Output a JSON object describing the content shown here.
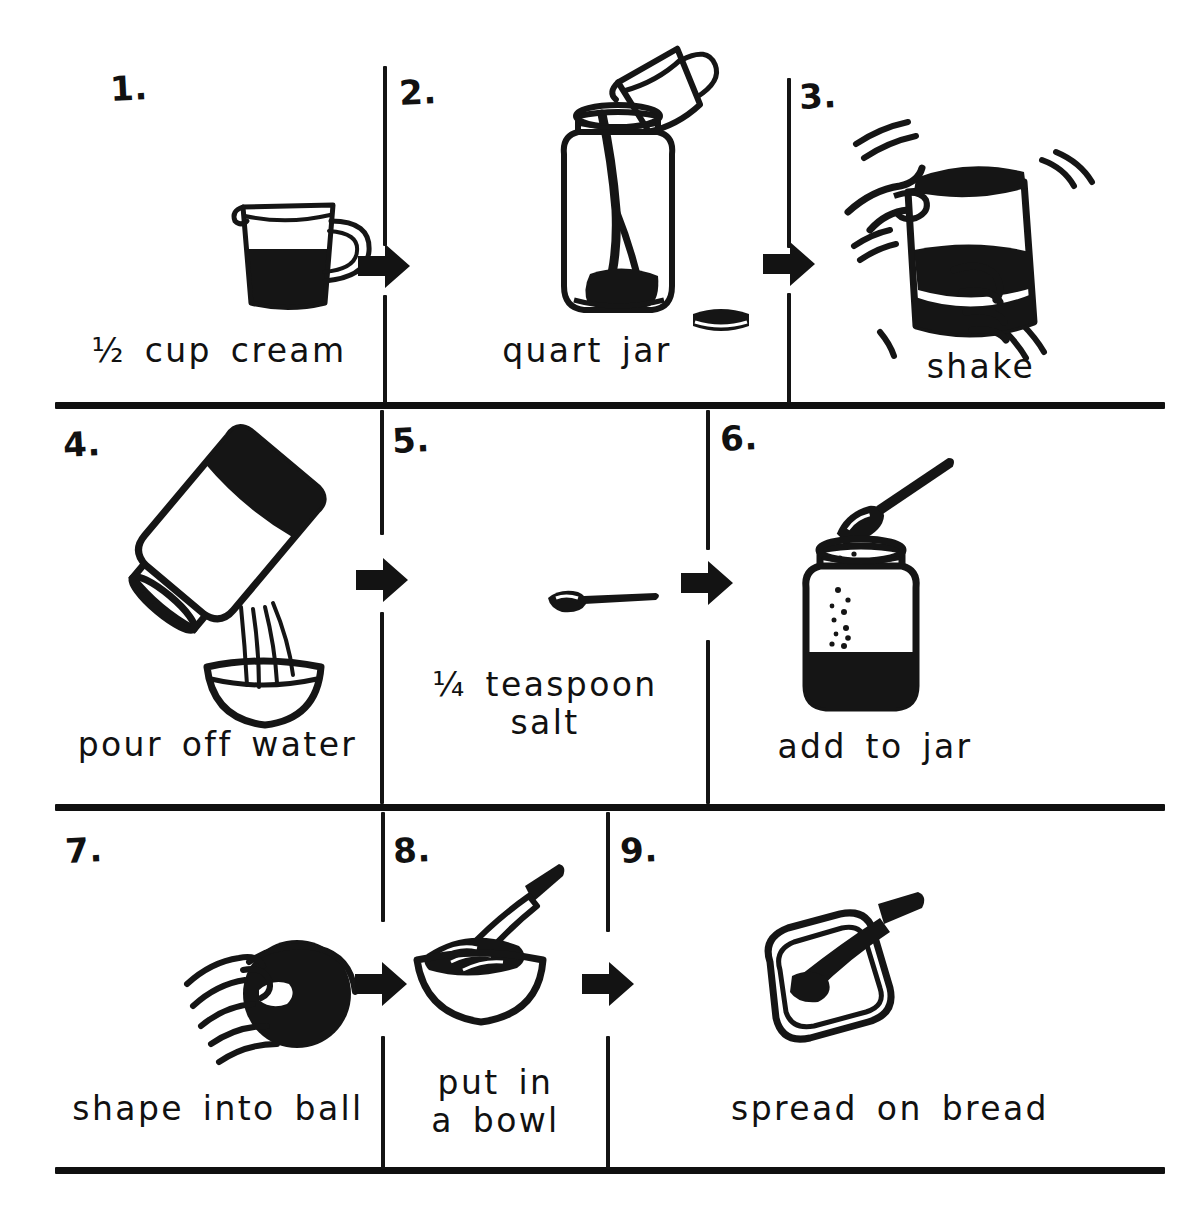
{
  "document": {
    "title": "How to Make Butter",
    "type": "illustrated recipe steps",
    "style": "hand-drawn black ink line art",
    "ink_color": "#111111",
    "paper_color": "#ffffff",
    "grid": {
      "rows": 3,
      "columns": 3,
      "total_steps": 9
    }
  },
  "steps": [
    {
      "number": "1.",
      "caption": "½ cup cream",
      "icon": "measuring-cup-icon",
      "icon_description": "measuring cup half filled with cream"
    },
    {
      "number": "2.",
      "caption": "quart jar",
      "icon": "jar-pouring-icon",
      "icon_description": "measuring cup pouring cream into a quart jar, lid beside it"
    },
    {
      "number": "3.",
      "caption": "shake",
      "icon": "hands-shaking-jar-icon",
      "icon_description": "two hands shaking the closed jar with motion lines"
    },
    {
      "number": "4.",
      "caption": "pour off water",
      "icon": "jar-pouring-water-icon",
      "icon_description": "tilted jar pouring buttermilk into a bowl"
    },
    {
      "number": "5.",
      "caption": "¼ teaspoon\nsalt",
      "icon": "teaspoon-icon",
      "icon_description": "a teaspoon seen from the side"
    },
    {
      "number": "6.",
      "caption": "add  to jar",
      "icon": "spoon-salting-jar-icon",
      "icon_description": "spoon sprinkling salt into the jar of butter"
    },
    {
      "number": "7.",
      "caption": "shape into ball",
      "icon": "hand-shaping-ball-icon",
      "icon_description": "hand pressing the butter into a ball"
    },
    {
      "number": "8.",
      "caption": "put in\na bowl",
      "icon": "bowl-with-knife-icon",
      "icon_description": "butter in a bowl with a knife resting in it"
    },
    {
      "number": "9.",
      "caption": "spread  on  bread",
      "icon": "bread-with-knife-icon",
      "icon_description": "knife spreading butter on a slice of bread"
    }
  ],
  "arrows": [
    {
      "name": "arrow-step1-to-step2",
      "direction": "right"
    },
    {
      "name": "arrow-step2-to-step3",
      "direction": "right"
    },
    {
      "name": "arrow-step4-to-step5",
      "direction": "right"
    },
    {
      "name": "arrow-step5-to-step6",
      "direction": "right"
    },
    {
      "name": "arrow-step7-to-step8",
      "direction": "right"
    },
    {
      "name": "arrow-step8-to-step9",
      "direction": "right"
    }
  ]
}
